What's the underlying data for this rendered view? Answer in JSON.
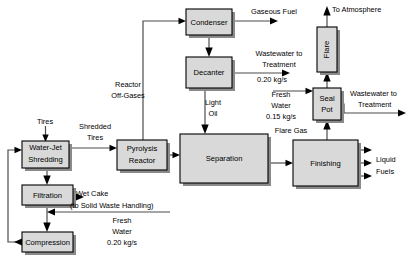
{
  "diagram": {
    "colors": {
      "box_fill": "#d9d9d9",
      "box_stroke": "#000000",
      "line": "#4d4d4d",
      "shadow": "#8a8a8a",
      "background": "#ffffff"
    },
    "units": [
      {
        "id": "water_jet_shredding",
        "label_lines": [
          "Water-Jet",
          "Shredding"
        ],
        "x": 22,
        "y": 141,
        "w": 47,
        "h": 27
      },
      {
        "id": "filtration",
        "label_lines": [
          "Filtration"
        ],
        "x": 22,
        "y": 185,
        "w": 51,
        "h": 20
      },
      {
        "id": "compression",
        "label_lines": [
          "Compression"
        ],
        "x": 22,
        "y": 232,
        "w": 51,
        "h": 20
      },
      {
        "id": "pyrolysis_reactor",
        "label_lines": [
          "Pyrolysis",
          "Reactor"
        ],
        "x": 117,
        "y": 140,
        "w": 50,
        "h": 30
      },
      {
        "id": "condenser",
        "label_lines": [
          "Condenser"
        ],
        "x": 186,
        "y": 9,
        "w": 46,
        "h": 26
      },
      {
        "id": "decanter",
        "label_lines": [
          "Decanter"
        ],
        "x": 186,
        "y": 57,
        "w": 46,
        "h": 31
      },
      {
        "id": "separation",
        "label_lines": [
          "Separation"
        ],
        "x": 180,
        "y": 134,
        "w": 88,
        "h": 49
      },
      {
        "id": "finishing",
        "label_lines": [
          "Finishing"
        ],
        "x": 293,
        "y": 140,
        "w": 65,
        "h": 46
      },
      {
        "id": "flare",
        "label_lines": [
          "Flare"
        ],
        "x": 317,
        "y": 27,
        "w": 20,
        "h": 45,
        "vertical": true
      },
      {
        "id": "seal_pot",
        "label_lines": [
          "Seal",
          "Pot"
        ],
        "x": 313,
        "y": 88,
        "w": 28,
        "h": 32
      }
    ],
    "streams": [
      {
        "id": "tires_feed",
        "label_lines": [
          "Tires"
        ],
        "label_x": 45,
        "label_y": 122
      },
      {
        "id": "shredded_tires",
        "label_lines": [
          "Shredded",
          "Tires"
        ],
        "label_x": 95,
        "label_y": 133
      },
      {
        "id": "reactor_off_gases",
        "label_lines": [
          "Reactor",
          "Off-Gases"
        ],
        "label_x": 128,
        "label_y": 90
      },
      {
        "id": "wet_cake",
        "label_lines": [
          "Wet Cake"
        ],
        "label_x": 100,
        "label_y": 194
      },
      {
        "id": "wet_cake_dest",
        "label_lines": [
          "(to Solid Waste Handling)"
        ],
        "label_x": 122,
        "label_y": 206
      },
      {
        "id": "fresh_water_filtration",
        "label_lines": [
          "Fresh",
          "Water",
          "0.20 kg/s"
        ],
        "label_x": 122,
        "label_y": 221
      },
      {
        "id": "gaseous_fuel",
        "label_lines": [
          "Gaseous Fuel"
        ],
        "label_x": 274,
        "label_y": 12
      },
      {
        "id": "wastewater_decanter",
        "label_lines": [
          "Wastewater to",
          "Treatment",
          "0.20 kg/s"
        ],
        "label_x": 279,
        "label_y": 54
      },
      {
        "id": "light_oil",
        "label_lines": [
          "Light",
          "Oil"
        ],
        "label_x": 213,
        "label_y": 106
      },
      {
        "id": "to_atmosphere",
        "label_lines": [
          "To Atmosphere"
        ],
        "label_x": 372,
        "label_y": 10
      },
      {
        "id": "fresh_water_seal_pot",
        "label_lines": [
          "Fresh",
          "Water",
          "0.15 kg/s"
        ],
        "label_x": 279,
        "label_y": 100
      },
      {
        "id": "flare_gas",
        "label_lines": [
          "Flare Gas"
        ],
        "label_x": 291,
        "label_y": 131
      },
      {
        "id": "wastewater_seal_pot",
        "label_lines": [
          "Wastewater to",
          "Treatment"
        ],
        "label_x": 383,
        "label_y": 94
      },
      {
        "id": "liquid_fuels",
        "label_lines": [
          "Liquid",
          "Fuels"
        ],
        "label_x": 388,
        "label_y": 160
      }
    ]
  }
}
